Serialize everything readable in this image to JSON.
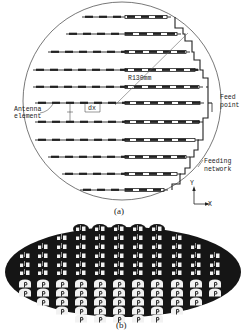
{
  "figure_a": {
    "caption": "(a)",
    "radius_label": "R130mm",
    "labels": {
      "antenna_element_line1": "Antenna",
      "antenna_element_line2": "element",
      "dx": "dx",
      "feed_point_line1": "Feed",
      "feed_point_line2": "point",
      "feeding_network_line1": "Feeding",
      "feeding_network_line2": "network",
      "axis_y": "Y",
      "axis_x": "X"
    },
    "circle": {
      "cx": 122,
      "cy": 101,
      "r": 99
    },
    "rows": [
      {
        "y": 17,
        "x_start": 82,
        "x_end": 175
      },
      {
        "y": 34,
        "x_start": 66,
        "x_end": 185
      },
      {
        "y": 52,
        "x_start": 48,
        "x_end": 194
      },
      {
        "y": 70,
        "x_start": 33,
        "x_end": 203
      },
      {
        "y": 87,
        "x_start": 33,
        "x_end": 207
      },
      {
        "y": 103,
        "x_start": 35,
        "x_end": 208
      },
      {
        "y": 122,
        "x_start": 35,
        "x_end": 207
      },
      {
        "y": 140,
        "x_start": 35,
        "x_end": 203
      },
      {
        "y": 157,
        "x_start": 48,
        "x_end": 194
      },
      {
        "y": 174,
        "x_start": 62,
        "x_end": 185
      },
      {
        "y": 190,
        "x_start": 80,
        "x_end": 172
      }
    ],
    "colors": {
      "line": "#222222",
      "background": "#ffffff"
    }
  },
  "figure_b": {
    "caption": "(b)",
    "ellipse": {
      "cx": 123,
      "cy": 272,
      "rx": 118,
      "ry": 45
    },
    "columns_x": [
      25,
      43,
      62,
      81,
      100,
      119,
      138,
      157,
      177,
      196,
      215
    ],
    "small_rows": [
      {
        "y": 229,
        "cols": [
          3,
          4,
          5,
          6,
          7
        ]
      },
      {
        "y": 238,
        "cols": [
          2,
          3,
          4,
          5,
          6,
          7,
          8
        ]
      },
      {
        "y": 247,
        "cols": [
          1,
          2,
          3,
          4,
          5,
          6,
          7,
          8,
          9
        ]
      },
      {
        "y": 256,
        "cols": [
          0,
          1,
          2,
          3,
          4,
          5,
          6,
          7,
          8,
          9,
          10
        ]
      },
      {
        "y": 265,
        "cols": [
          0,
          1,
          2,
          3,
          4,
          5,
          6,
          7,
          8,
          9,
          10
        ]
      },
      {
        "y": 273,
        "cols": [
          0,
          1,
          2,
          3,
          4,
          5,
          6,
          7,
          8,
          9,
          10
        ]
      }
    ],
    "large_rows": [
      {
        "y": 284,
        "cols": [
          0,
          1,
          2,
          3,
          4,
          5,
          6,
          7,
          8,
          9,
          10
        ]
      },
      {
        "y": 293,
        "cols": [
          0,
          1,
          2,
          3,
          4,
          5,
          6,
          7,
          8,
          9,
          10
        ]
      },
      {
        "y": 302,
        "cols": [
          1,
          2,
          3,
          4,
          5,
          6,
          7,
          8,
          9
        ]
      },
      {
        "y": 311,
        "cols": [
          2,
          3,
          4,
          5,
          6,
          7,
          8
        ]
      },
      {
        "y": 319,
        "cols": [
          3,
          4,
          5,
          6,
          7
        ]
      }
    ],
    "colors": {
      "substrate": "#151515",
      "element": "#f2f2f2"
    }
  }
}
